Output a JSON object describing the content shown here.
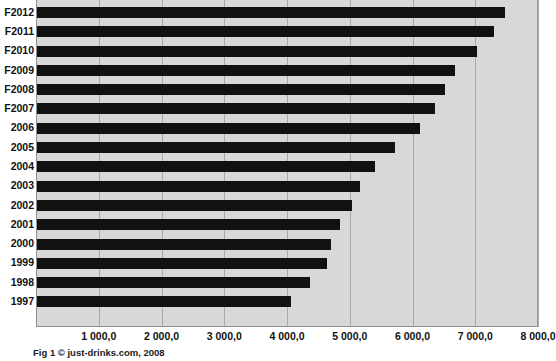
{
  "caption": "Fig 1 © just-drinks.com, 2008",
  "colors": {
    "bar": "#111111",
    "plot_background": "#d8d8d8",
    "gridline": "#a9a9a9",
    "axis": "#8f8f8f",
    "text": "#111111"
  },
  "chart_data": {
    "type": "bar",
    "orientation": "horizontal",
    "title": "",
    "subtitle": "",
    "xlabel": "",
    "ylabel": "",
    "xlim": [
      0,
      8000
    ],
    "grid": true,
    "legend": false,
    "legend_position": "none",
    "xticks": [
      0,
      1000,
      2000,
      3000,
      4000,
      5000,
      6000,
      7000,
      8000
    ],
    "xticklabels": [
      "",
      "1 000,0",
      "2 000,0",
      "3 000,0",
      "4 000,0",
      "5 000,0",
      "6 000,0",
      "7 000,0",
      "8 000,0"
    ],
    "categories": [
      "F2012",
      "F2011",
      "F2010",
      "F2009",
      "F2008",
      "F2007",
      "2006",
      "2005",
      "2004",
      "2003",
      "2002",
      "2001",
      "2000",
      "1999",
      "1998",
      "1997"
    ],
    "values": [
      7480.0,
      7300.0,
      7020.0,
      6680.0,
      6510.0,
      6360.0,
      6120.0,
      5720.0,
      5400.0,
      5160.0,
      5030.0,
      4840.0,
      4700.0,
      4640.0,
      4370.0,
      4070.0
    ],
    "series": [
      {
        "name": "Volume",
        "values": [
          7480.0,
          7300.0,
          7020.0,
          6680.0,
          6510.0,
          6360.0,
          6120.0,
          5720.0,
          5400.0,
          5160.0,
          5030.0,
          4840.0,
          4700.0,
          4640.0,
          4370.0,
          4070.0
        ]
      }
    ]
  }
}
